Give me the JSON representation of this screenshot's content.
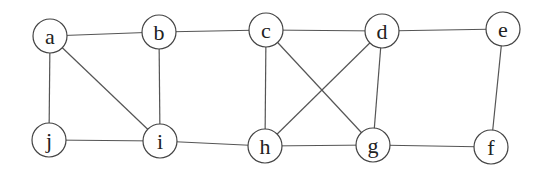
{
  "graph": {
    "nodes": [
      {
        "id": "a",
        "label": "a",
        "x": 50,
        "y": 36
      },
      {
        "id": "b",
        "label": "b",
        "x": 159,
        "y": 32
      },
      {
        "id": "c",
        "label": "c",
        "x": 266,
        "y": 30
      },
      {
        "id": "d",
        "label": "d",
        "x": 382,
        "y": 31
      },
      {
        "id": "e",
        "label": "e",
        "x": 503,
        "y": 29
      },
      {
        "id": "j",
        "label": "j",
        "x": 49,
        "y": 140
      },
      {
        "id": "i",
        "label": "i",
        "x": 160,
        "y": 141
      },
      {
        "id": "h",
        "label": "h",
        "x": 265,
        "y": 146
      },
      {
        "id": "g",
        "label": "g",
        "x": 373,
        "y": 145
      },
      {
        "id": "f",
        "label": "f",
        "x": 491,
        "y": 147
      }
    ],
    "edges": [
      [
        "a",
        "b"
      ],
      [
        "b",
        "c"
      ],
      [
        "c",
        "d"
      ],
      [
        "d",
        "e"
      ],
      [
        "a",
        "j"
      ],
      [
        "a",
        "i"
      ],
      [
        "b",
        "i"
      ],
      [
        "c",
        "h"
      ],
      [
        "c",
        "g"
      ],
      [
        "d",
        "h"
      ],
      [
        "d",
        "g"
      ],
      [
        "e",
        "f"
      ],
      [
        "j",
        "i"
      ],
      [
        "i",
        "h"
      ],
      [
        "h",
        "g"
      ],
      [
        "g",
        "f"
      ]
    ],
    "node_radius": 17
  }
}
